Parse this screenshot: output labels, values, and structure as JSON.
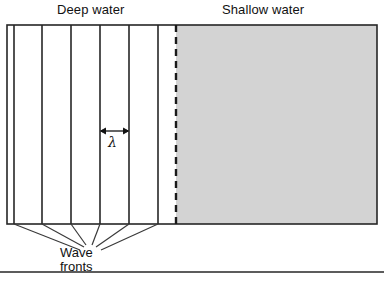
{
  "figure": {
    "type": "physics-diagram",
    "labels": {
      "deep_water": "Deep water",
      "shallow_water": "Shallow water",
      "wavelength_symbol": "λ",
      "wave_fronts_line1": "Wave",
      "wave_fronts_line2": "fronts"
    },
    "colors": {
      "shallow_water_fill": "#d3d3d3",
      "deep_water_fill": "#ffffff",
      "line": "#262626",
      "text": "#111111",
      "page_background": "#ffffff"
    },
    "geometry": {
      "box": {
        "x": 7,
        "y": 25,
        "width": 370,
        "height": 199
      },
      "boundary_x": 176,
      "wave_front_x": [
        14,
        42,
        71,
        100,
        129,
        158
      ],
      "wavelength_arrow": {
        "x1": 100,
        "x2": 129,
        "y": 131
      },
      "leader_target": {
        "x": 88,
        "y": 243
      },
      "footer_rule_y": 272
    }
  }
}
